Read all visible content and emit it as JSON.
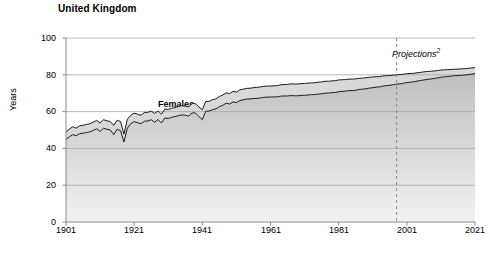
{
  "chart_data": {
    "type": "area",
    "title": "United Kingdom",
    "subtitle": "",
    "xlabel": "",
    "ylabel": "Years",
    "xlim": [
      1901,
      2021
    ],
    "ylim": [
      0,
      100
    ],
    "grid": true,
    "grid_axis": "y",
    "legend_position": "inline-annotation",
    "stacked": false,
    "x_ticks": [
      1901,
      1921,
      1941,
      1961,
      1981,
      2001,
      2021
    ],
    "y_ticks": [
      0,
      20,
      40,
      60,
      80,
      100
    ],
    "annotations": [
      {
        "text": "Projections",
        "superscript": "2",
        "x": 1998,
        "style": "italic",
        "marker": "dashed-vertical-line"
      }
    ],
    "series": [
      {
        "name": "Females",
        "label_x": 1928,
        "label_y": 67,
        "fill": "#d9d9d9",
        "line": "#1a1a1a",
        "x": [
          1901,
          1902,
          1903,
          1904,
          1905,
          1906,
          1907,
          1908,
          1909,
          1910,
          1911,
          1912,
          1913,
          1914,
          1915,
          1916,
          1917,
          1918,
          1919,
          1920,
          1921,
          1922,
          1923,
          1924,
          1925,
          1926,
          1927,
          1928,
          1929,
          1930,
          1931,
          1932,
          1933,
          1934,
          1935,
          1936,
          1937,
          1938,
          1939,
          1940,
          1941,
          1942,
          1943,
          1944,
          1945,
          1946,
          1947,
          1948,
          1949,
          1950,
          1951,
          1952,
          1953,
          1954,
          1955,
          1956,
          1957,
          1958,
          1959,
          1960,
          1961,
          1962,
          1963,
          1964,
          1965,
          1966,
          1967,
          1968,
          1969,
          1970,
          1971,
          1972,
          1973,
          1974,
          1975,
          1976,
          1977,
          1978,
          1979,
          1980,
          1981,
          1982,
          1983,
          1984,
          1985,
          1986,
          1987,
          1988,
          1989,
          1990,
          1991,
          1992,
          1993,
          1994,
          1995,
          1996,
          1997,
          1998,
          1999,
          2000,
          2001,
          2002,
          2003,
          2004,
          2005,
          2006,
          2007,
          2008,
          2009,
          2010,
          2011,
          2012,
          2013,
          2014,
          2015,
          2016,
          2017,
          2018,
          2019,
          2020,
          2021
        ],
        "values": [
          49.0,
          50.5,
          51.8,
          51.0,
          52.3,
          52.6,
          53.0,
          53.4,
          54.3,
          55.2,
          53.8,
          55.6,
          55.0,
          54.6,
          52.5,
          55.3,
          54.6,
          47.8,
          55.9,
          58.0,
          59.2,
          58.6,
          58.0,
          59.5,
          59.6,
          60.3,
          59.0,
          60.4,
          58.6,
          61.4,
          61.2,
          61.8,
          62.2,
          62.8,
          63.2,
          63.0,
          62.6,
          64.4,
          64.3,
          62.5,
          61.0,
          65.5,
          65.6,
          66.5,
          66.9,
          68.2,
          69.0,
          70.2,
          69.8,
          71.0,
          70.6,
          71.8,
          72.2,
          72.6,
          72.7,
          73.0,
          73.2,
          73.4,
          73.7,
          73.9,
          73.9,
          74.0,
          74.1,
          74.6,
          74.7,
          74.8,
          75.1,
          75.0,
          75.0,
          75.2,
          75.3,
          75.5,
          75.6,
          75.7,
          76.0,
          76.1,
          76.5,
          76.5,
          76.7,
          76.8,
          77.2,
          77.3,
          77.4,
          77.7,
          77.6,
          77.8,
          78.1,
          78.2,
          78.4,
          78.7,
          78.8,
          79.0,
          79.0,
          79.4,
          79.5,
          79.6,
          79.8,
          80.0,
          80.1,
          80.3,
          80.6,
          80.7,
          80.8,
          81.1,
          81.3,
          81.6,
          81.8,
          81.9,
          82.1,
          82.3,
          82.6,
          82.7,
          82.8,
          82.9,
          83.0,
          83.1,
          83.2,
          83.3,
          83.5,
          83.7,
          83.9
        ],
        "unit": "years"
      },
      {
        "name": "Males",
        "label_x": 1932,
        "label_y": 32,
        "fill_gradient_top": "#bfbfbf",
        "fill_gradient_bottom": "#f2f2f2",
        "line": "#1a1a1a",
        "x": [
          1901,
          1902,
          1903,
          1904,
          1905,
          1906,
          1907,
          1908,
          1909,
          1910,
          1911,
          1912,
          1913,
          1914,
          1915,
          1916,
          1917,
          1918,
          1919,
          1920,
          1921,
          1922,
          1923,
          1924,
          1925,
          1926,
          1927,
          1928,
          1929,
          1930,
          1931,
          1932,
          1933,
          1934,
          1935,
          1936,
          1937,
          1938,
          1939,
          1940,
          1941,
          1942,
          1943,
          1944,
          1945,
          1946,
          1947,
          1948,
          1949,
          1950,
          1951,
          1952,
          1953,
          1954,
          1955,
          1956,
          1957,
          1958,
          1959,
          1960,
          1961,
          1962,
          1963,
          1964,
          1965,
          1966,
          1967,
          1968,
          1969,
          1970,
          1971,
          1972,
          1973,
          1974,
          1975,
          1976,
          1977,
          1978,
          1979,
          1980,
          1981,
          1982,
          1983,
          1984,
          1985,
          1986,
          1987,
          1988,
          1989,
          1990,
          1991,
          1992,
          1993,
          1994,
          1995,
          1996,
          1997,
          1998,
          1999,
          2000,
          2001,
          2002,
          2003,
          2004,
          2005,
          2006,
          2007,
          2008,
          2009,
          2010,
          2011,
          2012,
          2013,
          2014,
          2015,
          2016,
          2017,
          2018,
          2019,
          2020,
          2021
        ],
        "values": [
          45.0,
          46.3,
          47.5,
          46.9,
          48.0,
          48.3,
          48.6,
          49.0,
          49.8,
          50.7,
          49.2,
          51.0,
          50.4,
          50.0,
          47.5,
          50.4,
          49.6,
          43.5,
          51.0,
          53.4,
          54.5,
          54.0,
          53.4,
          54.8,
          54.9,
          55.6,
          54.2,
          55.7,
          53.8,
          56.5,
          56.3,
          56.9,
          57.3,
          57.8,
          58.2,
          58.0,
          57.6,
          59.3,
          59.2,
          57.3,
          55.6,
          60.2,
          60.3,
          61.1,
          61.5,
          62.7,
          63.4,
          64.6,
          64.1,
          65.3,
          64.9,
          66.0,
          66.4,
          66.8,
          66.9,
          67.1,
          67.2,
          67.4,
          67.7,
          67.9,
          67.9,
          68.0,
          68.0,
          68.4,
          68.5,
          68.5,
          68.7,
          68.6,
          68.6,
          68.8,
          68.9,
          69.0,
          69.2,
          69.3,
          69.5,
          69.7,
          70.0,
          70.1,
          70.3,
          70.4,
          70.8,
          71.0,
          71.1,
          71.4,
          71.4,
          71.6,
          72.0,
          72.2,
          72.4,
          72.8,
          73.0,
          73.3,
          73.4,
          73.9,
          74.1,
          74.3,
          74.6,
          74.9,
          75.1,
          75.4,
          75.8,
          76.0,
          76.2,
          76.6,
          76.9,
          77.2,
          77.5,
          77.7,
          78.0,
          78.3,
          78.7,
          78.9,
          79.1,
          79.3,
          79.5,
          79.6,
          79.7,
          79.9,
          80.1,
          80.4,
          80.6
        ],
        "unit": "years"
      }
    ]
  },
  "axis": {
    "y_title": "Years",
    "y_tick_labels": [
      "100",
      "80",
      "60",
      "40",
      "20",
      "0"
    ],
    "x_tick_labels": [
      "1901",
      "1921",
      "1941",
      "1961",
      "1981",
      "2001",
      "2021"
    ]
  },
  "labels": {
    "females": "Females",
    "males": "Males",
    "projections": "Projections",
    "projections_footnote": "2"
  },
  "colors": {
    "background": "#ffffff",
    "axis_line": "#808080",
    "grid_line": "#a6a6a6",
    "series_line": "#1a1a1a",
    "females_fill": "#d9d9d9",
    "males_fill_top": "#bfbfbf",
    "males_fill_bottom": "#f2f2f2",
    "projection_line": "#808080",
    "text": "#000000"
  }
}
